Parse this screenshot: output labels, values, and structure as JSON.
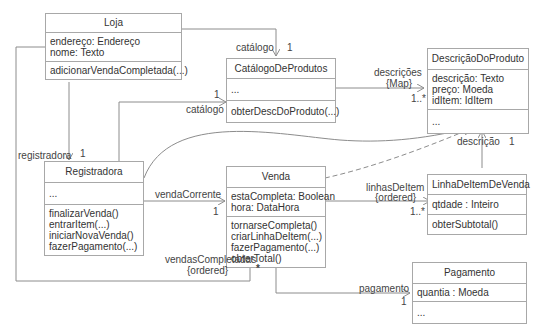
{
  "diagram": {
    "type": "UML class diagram",
    "classes": {
      "loja": {
        "name": "Loja",
        "attributes": [
          "endereço: Endereço",
          "nome: Texto"
        ],
        "operations": [
          "adicionarVendaCompletada(...)"
        ]
      },
      "catalogo": {
        "name": "CatálogoDeProdutos",
        "attributes": [
          "..."
        ],
        "operations": [
          "obterDescDoProduto(...)"
        ]
      },
      "descricao": {
        "name": "DescriçãoDoProduto",
        "attributes": [
          "descrição: Texto",
          "preço: Moeda",
          "idItem: IdItem"
        ],
        "operations": [
          "..."
        ]
      },
      "registradora": {
        "name": "Registradora",
        "attributes": [
          "..."
        ],
        "operations": [
          "finalizarVenda()",
          "entrarItem(...)",
          "iniciarNovaVenda()",
          "fazerPagamento(...)"
        ]
      },
      "venda": {
        "name": "Venda",
        "attributes": [
          "estaCompleta: Boolean",
          "hora: DataHora"
        ],
        "operations": [
          "tornarseCompleta()",
          "criarLinhaDeItem(...)",
          "fazerPagamento(...)",
          "obterTotal()"
        ]
      },
      "linha": {
        "name": "LinhaDeItemDeVenda",
        "attributes": [
          "qtdade : Inteiro"
        ],
        "operations": [
          "obterSubtotal()"
        ]
      },
      "pagamento": {
        "name": "Pagamento",
        "attributes": [
          "quantia : Moeda"
        ],
        "operations": [
          "..."
        ]
      }
    },
    "labels": {
      "catalogo_top_role": "catálogo",
      "catalogo_top_mult": "1",
      "catalogo_left_role": "catálogo",
      "catalogo_left_mult": "1",
      "descricoes_role": "descrições",
      "descricoes_qual": "{Map}",
      "descricoes_mult": "1..*",
      "registradora_role": "registradora",
      "registradora_mult": "1",
      "vendaCorrente_role": "vendaCorrente",
      "vendaCorrente_mult": "1",
      "linhas_role": "linhasDeItem",
      "linhas_qual": "{ordered}",
      "linhas_mult": "1..*",
      "descricao_role": "descrição",
      "descricao_mult": "1",
      "vendasCompletadas_role": "vendasCompletadas",
      "vendasCompletadas_qual": "{ordered}",
      "vendasCompletadas_mult": "*",
      "pagamento_role": "pagamento",
      "pagamento_mult": "1"
    },
    "colors": {
      "line": "#8c8c8c",
      "border": "#a8a8a8",
      "text": "#333333"
    }
  }
}
